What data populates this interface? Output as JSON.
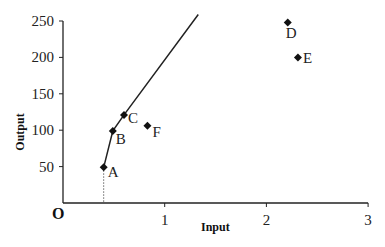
{
  "chart_data": {
    "type": "scatter",
    "title": "",
    "xlabel": "Input",
    "ylabel": "Output",
    "origin_label": "O",
    "xlim": [
      0,
      3
    ],
    "ylim": [
      0,
      250
    ],
    "x_ticks": [
      1,
      2,
      3
    ],
    "y_ticks": [
      50,
      100,
      150,
      200,
      250
    ],
    "grid": false,
    "legend": null,
    "points": [
      {
        "label": "A",
        "x": 0.4,
        "y": 49
      },
      {
        "label": "B",
        "x": 0.49,
        "y": 99
      },
      {
        "label": "C",
        "x": 0.6,
        "y": 121
      },
      {
        "label": "D",
        "x": 2.21,
        "y": 248
      },
      {
        "label": "E",
        "x": 2.31,
        "y": 200
      },
      {
        "label": "F",
        "x": 0.83,
        "y": 106
      }
    ],
    "frontier_line": {
      "description": "Efficiency frontier through A, B, C extending upward",
      "x": [
        0.4,
        0.49,
        0.6,
        1.33
      ],
      "y": [
        49,
        99,
        121,
        259
      ]
    },
    "guide_line": {
      "style": "dotted",
      "from": {
        "x": 0.4,
        "y": 49
      },
      "to": {
        "x": 0.4,
        "y": 0
      }
    }
  }
}
